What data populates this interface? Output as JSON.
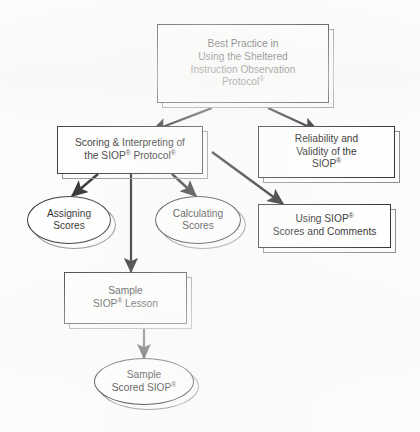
{
  "diagram": {
    "type": "flowchart",
    "background_color": "#fcfcfc",
    "line_color": "#1a1a1a",
    "node_fill": "#ffffff",
    "shadow_color": "#8a8a8a"
  },
  "nodes": {
    "root": {
      "id": "best-practice",
      "shape": "rectangle",
      "lines": [
        "Best Practice in",
        "Using the Sheltered",
        "Instruction Observation",
        "Protocol"
      ],
      "superscript": "®",
      "superscript_on_line": 4
    },
    "scoring": {
      "id": "scoring-interpreting",
      "shape": "rectangle",
      "lines": [
        "Scoring & Interpreting of",
        "the SIOP",
        " Protocol"
      ],
      "superscript": "®"
    },
    "reliability": {
      "id": "reliability-validity",
      "shape": "rectangle",
      "lines": [
        "Reliability and",
        "Validity of the",
        "SIOP"
      ],
      "superscript": "®"
    },
    "assigning": {
      "id": "assigning-scores",
      "shape": "ellipse",
      "lines": [
        "Assigning",
        "Scores"
      ]
    },
    "calculating": {
      "id": "calculating-scores",
      "shape": "ellipse",
      "lines": [
        "Calculating",
        "Scores"
      ]
    },
    "using": {
      "id": "using-siop-scores",
      "shape": "rectangle",
      "lines": [
        "Using SIOP",
        "Scores and Comments"
      ],
      "superscript": "®"
    },
    "sample_lesson": {
      "id": "sample-siop-lesson",
      "shape": "rectangle",
      "lines": [
        "Sample",
        "SIOP",
        " Lesson"
      ],
      "superscript": "®"
    },
    "sample_scored": {
      "id": "sample-scored-siop",
      "shape": "ellipse",
      "lines": [
        "Sample",
        "Scored SIOP"
      ],
      "superscript": "®"
    }
  },
  "edges": [
    {
      "from": "best-practice",
      "to": "scoring-interpreting",
      "style": "arrow"
    },
    {
      "from": "best-practice",
      "to": "reliability-validity",
      "style": "arrow"
    },
    {
      "from": "scoring-interpreting",
      "to": "assigning-scores",
      "style": "arrow"
    },
    {
      "from": "scoring-interpreting",
      "to": "calculating-scores",
      "style": "arrow"
    },
    {
      "from": "scoring-interpreting",
      "to": "using-siop-scores",
      "style": "arrow"
    },
    {
      "from": "scoring-interpreting",
      "to": "sample-siop-lesson",
      "style": "arrow"
    },
    {
      "from": "sample-siop-lesson",
      "to": "sample-scored-siop",
      "style": "arrow"
    }
  ]
}
